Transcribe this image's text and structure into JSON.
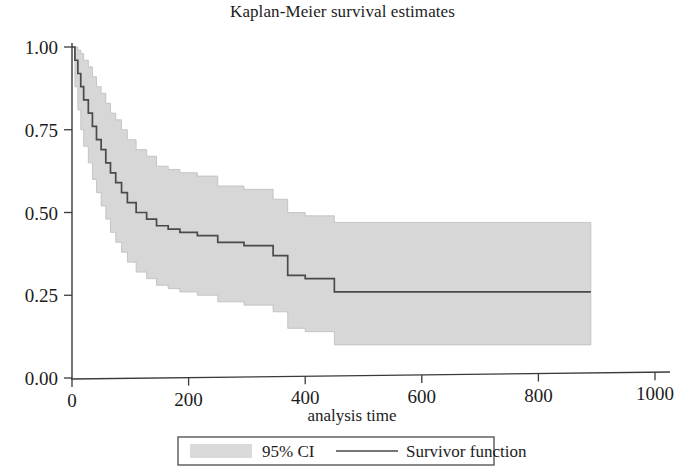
{
  "chart_data": {
    "type": "line",
    "title": "Kaplan-Meier survival estimates",
    "xlabel": "analysis time",
    "ylabel": "",
    "xlim": [
      0,
      1000
    ],
    "ylim": [
      0.0,
      1.0
    ],
    "grid": false,
    "xticks": [
      0,
      200,
      400,
      600,
      800,
      1000
    ],
    "xtick_labels": [
      "0",
      "200",
      "400",
      "600",
      "800",
      "1000"
    ],
    "yticks": [
      0.0,
      0.25,
      0.5,
      0.75,
      1.0
    ],
    "ytick_labels": [
      "0.00",
      "0.25",
      "0.50",
      "0.75",
      "1.00"
    ],
    "legend_position": "below-axes",
    "legend": [
      {
        "label": "95% CI",
        "marker": "band",
        "color": "#d7d7d7"
      },
      {
        "label": "Survivor function",
        "marker": "line",
        "color": "#4a4a4a"
      }
    ],
    "series": [
      {
        "name": "Survivor function",
        "step": "post",
        "color": "#4a4a4a",
        "x": [
          0,
          5,
          10,
          15,
          20,
          28,
          35,
          42,
          50,
          58,
          66,
          75,
          85,
          95,
          110,
          128,
          145,
          165,
          185,
          215,
          250,
          295,
          345,
          370,
          400,
          450,
          890
        ],
        "y": [
          1.0,
          0.96,
          0.92,
          0.88,
          0.84,
          0.8,
          0.76,
          0.72,
          0.69,
          0.65,
          0.62,
          0.59,
          0.56,
          0.53,
          0.5,
          0.48,
          0.46,
          0.45,
          0.44,
          0.43,
          0.41,
          0.4,
          0.37,
          0.31,
          0.3,
          0.26,
          0.26
        ]
      },
      {
        "name": "95% CI upper",
        "step": "post",
        "color": "#d7d7d7",
        "x": [
          0,
          5,
          10,
          15,
          20,
          28,
          35,
          42,
          50,
          58,
          66,
          75,
          85,
          95,
          110,
          128,
          145,
          165,
          185,
          215,
          250,
          295,
          345,
          370,
          400,
          450,
          890
        ],
        "y": [
          1.0,
          1.0,
          0.99,
          0.98,
          0.96,
          0.94,
          0.91,
          0.88,
          0.86,
          0.83,
          0.8,
          0.78,
          0.75,
          0.72,
          0.69,
          0.67,
          0.64,
          0.63,
          0.62,
          0.61,
          0.58,
          0.57,
          0.54,
          0.5,
          0.49,
          0.47,
          0.47
        ]
      },
      {
        "name": "95% CI lower",
        "step": "post",
        "color": "#d7d7d7",
        "x": [
          0,
          5,
          10,
          15,
          20,
          28,
          35,
          42,
          50,
          58,
          66,
          75,
          85,
          95,
          110,
          128,
          145,
          165,
          185,
          215,
          250,
          295,
          345,
          370,
          400,
          450,
          890
        ],
        "y": [
          1.0,
          0.88,
          0.81,
          0.75,
          0.7,
          0.65,
          0.6,
          0.56,
          0.52,
          0.48,
          0.44,
          0.41,
          0.38,
          0.35,
          0.32,
          0.3,
          0.28,
          0.27,
          0.26,
          0.25,
          0.23,
          0.22,
          0.2,
          0.15,
          0.14,
          0.1,
          0.1
        ]
      }
    ],
    "annotations": []
  },
  "colors": {
    "ci_band": "#d7d7d7",
    "ci_band_edge": "#bdbdbd",
    "survivor_line": "#4a4a4a",
    "axis": "#3a3a3a",
    "text": "#1c1c1c",
    "legend_border": "#4a4a4a",
    "background": "#ffffff"
  }
}
